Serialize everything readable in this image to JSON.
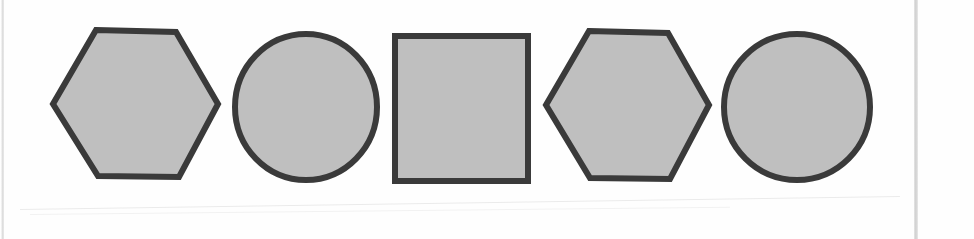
{
  "page": {
    "background_color": "#fefefe",
    "width": 974,
    "height": 239
  },
  "style": {
    "fill_color": "#bfbfbf",
    "stroke_color": "#3a3a3a",
    "stroke_width": 5,
    "gutter_line_color": "#d8d8d8"
  },
  "sequence": {
    "count": 5,
    "items": [
      {
        "index": 1,
        "shape": "hexagon",
        "label": "hexagon-1",
        "orientation": "flat-top",
        "cx": 135,
        "cy": 104,
        "rx": 83,
        "ry": 74,
        "fill": "#bfbfbf",
        "stroke": "#3a3a3a"
      },
      {
        "index": 2,
        "shape": "circle",
        "label": "circle-1",
        "cx": 306,
        "cy": 107,
        "rx": 72,
        "ry": 74,
        "fill": "#bfbfbf",
        "stroke": "#3a3a3a"
      },
      {
        "index": 3,
        "shape": "square",
        "label": "square-1",
        "x": 394,
        "y": 35,
        "width": 135,
        "height": 146,
        "fill": "#bfbfbf",
        "stroke": "#3a3a3a"
      },
      {
        "index": 4,
        "shape": "hexagon",
        "label": "hexagon-2",
        "orientation": "flat-top",
        "cx": 626,
        "cy": 105,
        "rx": 83,
        "ry": 74,
        "fill": "#bfbfbf",
        "stroke": "#3a3a3a"
      },
      {
        "index": 5,
        "shape": "circle",
        "label": "circle-2",
        "cx": 797,
        "cy": 107,
        "rx": 74,
        "ry": 74,
        "fill": "#bfbfbf",
        "stroke": "#3a3a3a"
      }
    ]
  },
  "artifacts": {
    "left_gutter": "page-edge-line",
    "right_gutter": "page-fold-line",
    "diagonal_streak": "scanner-artifact"
  }
}
